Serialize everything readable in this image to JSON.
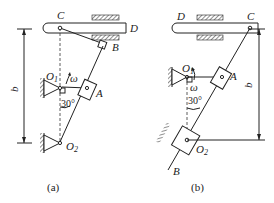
{
  "figure_a": {
    "caption": "(a)",
    "labels": {
      "C": "C",
      "D": "D",
      "B": "B",
      "O1": "O",
      "O1_sub": "1",
      "A": "A",
      "O2": "O",
      "O2_sub": "2",
      "omega": "ω",
      "angle": "30°",
      "b": "b"
    }
  },
  "figure_b": {
    "caption": "(b)",
    "labels": {
      "C": "C",
      "D": "D",
      "B": "B",
      "O1": "O",
      "O1_sub": "1",
      "A": "A",
      "O2": "O",
      "O2_sub": "2",
      "omega": "ω",
      "angle": "30°",
      "b": "b"
    }
  },
  "colors": {
    "line": "#222222",
    "background": "#ffffff"
  }
}
